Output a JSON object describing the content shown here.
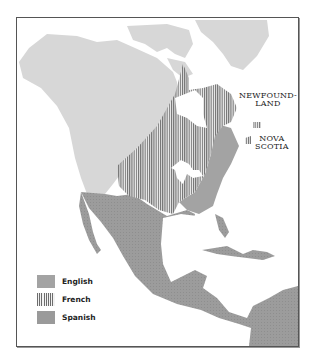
{
  "map": {
    "title": "",
    "colors": {
      "other_land": "#d7d7d7",
      "english": "#a3a3a3",
      "french_stripe": "#6d6d6d",
      "spanish": "#9a9a9a",
      "water": "#ffffff",
      "border": "#555555"
    },
    "labels": {
      "newfoundland_line1": "NEWFOUND-",
      "newfoundland_line2": "LAND",
      "nova_scotia_line1": "NOVA",
      "nova_scotia_line2": "SCOTIA"
    },
    "legend": [
      {
        "label": "English",
        "pattern": "solid-gray"
      },
      {
        "label": "French",
        "pattern": "vertical-stripes"
      },
      {
        "label": "Spanish",
        "pattern": "solid-gray-dark"
      }
    ]
  }
}
